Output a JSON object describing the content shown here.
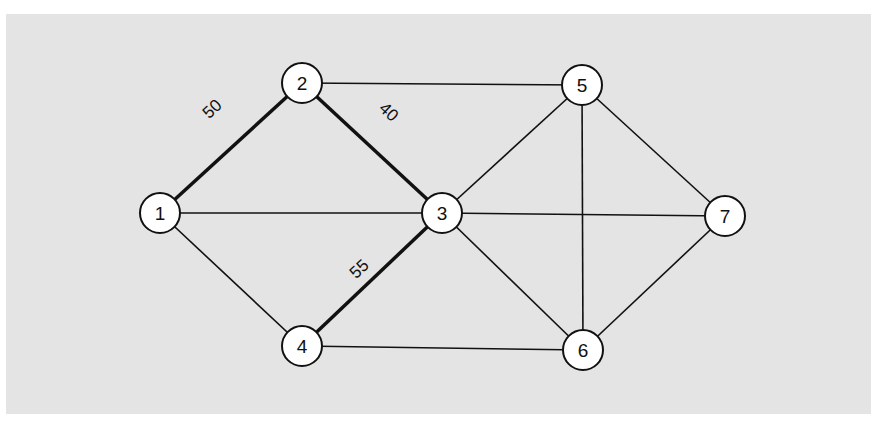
{
  "graph": {
    "nodes": [
      {
        "id": "1",
        "label": "1",
        "x": 160,
        "y": 213
      },
      {
        "id": "2",
        "label": "2",
        "x": 302,
        "y": 83
      },
      {
        "id": "3",
        "label": "3",
        "x": 442,
        "y": 213
      },
      {
        "id": "4",
        "label": "4",
        "x": 302,
        "y": 346
      },
      {
        "id": "5",
        "label": "5",
        "x": 582,
        "y": 85
      },
      {
        "id": "6",
        "label": "6",
        "x": 583,
        "y": 350
      },
      {
        "id": "7",
        "label": "7",
        "x": 725,
        "y": 216
      }
    ],
    "edges": [
      {
        "from": "1",
        "to": "2",
        "bold": true,
        "label": "50"
      },
      {
        "from": "2",
        "to": "3",
        "bold": true,
        "label": "40"
      },
      {
        "from": "3",
        "to": "4",
        "bold": true,
        "label": "55"
      },
      {
        "from": "1",
        "to": "3",
        "bold": false,
        "label": ""
      },
      {
        "from": "1",
        "to": "4",
        "bold": false,
        "label": ""
      },
      {
        "from": "2",
        "to": "5",
        "bold": false,
        "label": ""
      },
      {
        "from": "3",
        "to": "5",
        "bold": false,
        "label": ""
      },
      {
        "from": "3",
        "to": "6",
        "bold": false,
        "label": ""
      },
      {
        "from": "3",
        "to": "7",
        "bold": false,
        "label": ""
      },
      {
        "from": "4",
        "to": "6",
        "bold": false,
        "label": ""
      },
      {
        "from": "5",
        "to": "6",
        "bold": false,
        "label": ""
      },
      {
        "from": "5",
        "to": "7",
        "bold": false,
        "label": ""
      },
      {
        "from": "6",
        "to": "7",
        "bold": false,
        "label": ""
      }
    ]
  },
  "labels": {
    "n1": "1",
    "n2": "2",
    "n3": "3",
    "n4": "4",
    "n5": "5",
    "n6": "6",
    "n7": "7",
    "e12": "50",
    "e23": "40",
    "e34": "55"
  }
}
